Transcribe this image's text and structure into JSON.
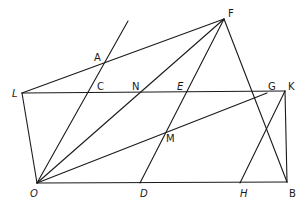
{
  "diagram": {
    "type": "geometric-construction",
    "points": {
      "F": {
        "x": 224,
        "y": 19
      },
      "A": {
        "x": 104,
        "y": 61
      },
      "L": {
        "x": 22,
        "y": 93
      },
      "C": {
        "x": 95,
        "y": 93
      },
      "N": {
        "x": 140,
        "y": 93
      },
      "E": {
        "x": 184,
        "y": 93
      },
      "G": {
        "x": 267,
        "y": 93
      },
      "K": {
        "x": 285,
        "y": 91
      },
      "M": {
        "x": 167,
        "y": 131
      },
      "O": {
        "x": 37,
        "y": 183
      },
      "D": {
        "x": 140,
        "y": 183
      },
      "H": {
        "x": 240,
        "y": 183
      },
      "B": {
        "x": 287,
        "y": 182
      },
      "T": {
        "x": 128,
        "y": 21
      }
    },
    "segments": [
      [
        "L",
        "F"
      ],
      [
        "L",
        "K"
      ],
      [
        "L",
        "O"
      ],
      [
        "O",
        "B"
      ],
      [
        "K",
        "B"
      ],
      [
        "O",
        "T"
      ],
      [
        "O",
        "F"
      ],
      [
        "O",
        "G"
      ],
      [
        "F",
        "B"
      ],
      [
        "F",
        "D"
      ],
      [
        "K",
        "H"
      ]
    ],
    "labels": [
      {
        "text": "F",
        "x": 228,
        "y": 17,
        "italic": false
      },
      {
        "text": "A",
        "x": 94,
        "y": 61,
        "italic": false
      },
      {
        "text": "L",
        "x": 12,
        "y": 97,
        "italic": true
      },
      {
        "text": "C",
        "x": 97,
        "y": 90,
        "italic": false
      },
      {
        "text": "N",
        "x": 132,
        "y": 90,
        "italic": false
      },
      {
        "text": "E",
        "x": 177,
        "y": 90,
        "italic": true
      },
      {
        "text": "G",
        "x": 268,
        "y": 90,
        "italic": false
      },
      {
        "text": "K",
        "x": 288,
        "y": 90,
        "italic": false
      },
      {
        "text": "M",
        "x": 166,
        "y": 142,
        "italic": false
      },
      {
        "text": "O",
        "x": 30,
        "y": 197,
        "italic": true
      },
      {
        "text": "D",
        "x": 140,
        "y": 197,
        "italic": true
      },
      {
        "text": "H",
        "x": 240,
        "y": 197,
        "italic": true
      },
      {
        "text": "B",
        "x": 289,
        "y": 197,
        "italic": false
      }
    ]
  }
}
